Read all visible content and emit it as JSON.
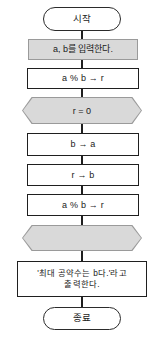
{
  "diagram": {
    "colors": {
      "shaded_fill": "#d9d9d9",
      "shaded_border": "#9a9a9a",
      "line": "#1f1f1f",
      "background": "#ffffff"
    },
    "nodes": [
      {
        "id": "start",
        "shape": "terminal",
        "label": "시작"
      },
      {
        "id": "input",
        "shape": "shaded-rectangle",
        "label": "a, b를 입력한다."
      },
      {
        "id": "mod1",
        "shape": "process",
        "label": "a % b → r"
      },
      {
        "id": "cond",
        "shape": "shaded-hexagon",
        "label": "r = 0"
      },
      {
        "id": "assign-b-to-a",
        "shape": "process",
        "label": "b → a"
      },
      {
        "id": "assign-r-to-b",
        "shape": "process",
        "label": "r → b"
      },
      {
        "id": "mod2",
        "shape": "process",
        "label": "a % b → r"
      },
      {
        "id": "blank",
        "shape": "shaded-hexagon",
        "label": ""
      },
      {
        "id": "output",
        "shape": "process",
        "label": "'최대 공약수는 b다.'라고\n출력한다."
      },
      {
        "id": "end",
        "shape": "terminal",
        "label": "종료"
      }
    ]
  }
}
